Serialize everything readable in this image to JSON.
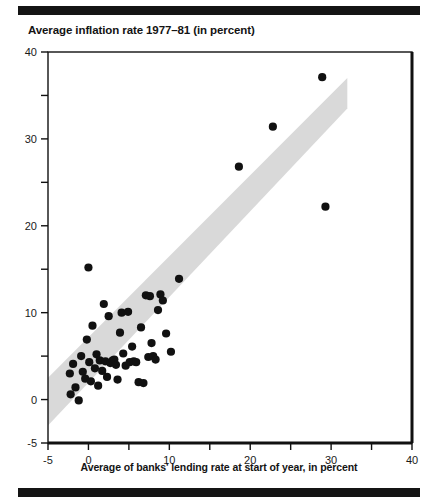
{
  "figure": {
    "title": "Average inflation rate 1977–81 (in percent)",
    "xlabel": "Average of banks' lending rate at start of year, in percent",
    "rule_color": "#141414",
    "band_color": "#d9d9d9",
    "point_color": "#111111"
  },
  "chart_data": {
    "type": "scatter",
    "title": "Average inflation rate 1977–81 (in percent)",
    "xlabel": "Average of banks' lending rate at start of year, in percent",
    "ylabel": "Average inflation rate 1977–81 (in percent)",
    "xlim": [
      -5,
      40
    ],
    "ylim": [
      -5,
      40
    ],
    "xticks": [
      -5,
      0,
      5,
      10,
      15,
      20,
      25,
      30,
      35,
      40
    ],
    "xtick_labels": [
      "-5",
      "0",
      "",
      "10",
      "",
      "20",
      "",
      "30",
      "",
      "40"
    ],
    "yticks": [
      -5,
      0,
      5,
      10,
      15,
      20,
      25,
      30,
      35,
      40
    ],
    "ytick_labels": [
      "-5",
      "0",
      "",
      "10",
      "",
      "20",
      "",
      "30",
      "",
      "40"
    ],
    "grid": false,
    "legend": null,
    "marker": "filled-circle",
    "marker_size": 5,
    "annotations": [
      {
        "type": "shaded-band",
        "description": "diagonal grey band roughly along the 45-degree line, offset about +5 to -5 percentage points",
        "color": "#d9d9d9",
        "polygon": [
          [
            -5,
            2.5
          ],
          [
            -5,
            -3.0
          ],
          [
            32.0,
            33.5
          ],
          [
            32.0,
            37.0
          ]
        ]
      }
    ],
    "points": [
      [
        -2.3,
        3.0
      ],
      [
        -2.2,
        0.6
      ],
      [
        -1.9,
        4.1
      ],
      [
        -1.6,
        1.4
      ],
      [
        -1.2,
        -0.1
      ],
      [
        -0.9,
        5.0
      ],
      [
        -0.7,
        3.2
      ],
      [
        -0.4,
        2.4
      ],
      [
        -0.2,
        6.9
      ],
      [
        0.0,
        15.2
      ],
      [
        0.1,
        4.3
      ],
      [
        0.3,
        2.1
      ],
      [
        0.5,
        8.5
      ],
      [
        0.8,
        3.6
      ],
      [
        1.0,
        5.2
      ],
      [
        1.2,
        1.6
      ],
      [
        1.4,
        4.5
      ],
      [
        1.7,
        3.3
      ],
      [
        1.9,
        11.0
      ],
      [
        2.1,
        4.4
      ],
      [
        2.3,
        2.6
      ],
      [
        2.5,
        9.6
      ],
      [
        2.7,
        4.2
      ],
      [
        3.0,
        4.5
      ],
      [
        3.2,
        4.6
      ],
      [
        3.4,
        4.0
      ],
      [
        3.6,
        2.3
      ],
      [
        3.9,
        7.7
      ],
      [
        4.1,
        10.0
      ],
      [
        4.3,
        5.3
      ],
      [
        4.6,
        3.9
      ],
      [
        4.9,
        10.1
      ],
      [
        5.1,
        4.3
      ],
      [
        5.4,
        6.1
      ],
      [
        5.6,
        4.4
      ],
      [
        5.9,
        4.3
      ],
      [
        6.2,
        2.0
      ],
      [
        6.5,
        8.3
      ],
      [
        6.8,
        1.9
      ],
      [
        7.1,
        12.0
      ],
      [
        7.4,
        4.9
      ],
      [
        7.6,
        11.9
      ],
      [
        7.8,
        6.5
      ],
      [
        8.0,
        5.0
      ],
      [
        8.3,
        4.6
      ],
      [
        8.6,
        10.3
      ],
      [
        8.9,
        12.1
      ],
      [
        9.2,
        11.4
      ],
      [
        9.6,
        7.6
      ],
      [
        10.2,
        5.5
      ],
      [
        11.2,
        13.9
      ],
      [
        18.6,
        26.8
      ],
      [
        22.8,
        31.4
      ],
      [
        28.9,
        37.1
      ],
      [
        29.3,
        22.2
      ]
    ]
  }
}
